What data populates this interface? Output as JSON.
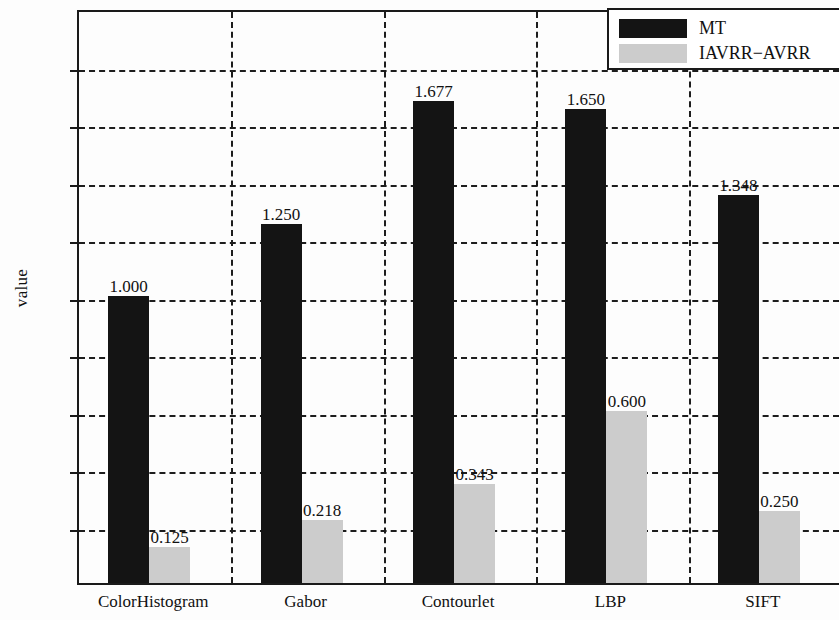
{
  "chart_data": {
    "type": "bar",
    "title": "",
    "subtitle": "",
    "xlabel": "",
    "ylabel": "value",
    "categories": [
      "ColorHistogram",
      "Gabor",
      "Contourlet",
      "LBP",
      "SIFT"
    ],
    "series": [
      {
        "name": "MT",
        "color": "#141414",
        "values": [
          1.0,
          1.25,
          1.677,
          1.65,
          1.348
        ],
        "labels": [
          "1.000",
          "1.250",
          "1.677",
          "1.650",
          "1.348"
        ]
      },
      {
        "name": "IAVRR−AVRR",
        "color": "#cccccc",
        "values": [
          0.125,
          0.218,
          0.343,
          0.6,
          0.25
        ],
        "labels": [
          "0.125",
          "0.218",
          "0.343",
          "0.600",
          "0.250"
        ]
      }
    ],
    "ylim": [
      0,
      2
    ],
    "ytick_values": [
      0,
      0.2,
      0.4,
      0.6,
      0.8,
      1,
      1.2,
      1.4,
      1.6,
      1.8,
      2
    ],
    "ytick_labels": [
      "0",
      "0.2",
      "0.4",
      "0.6",
      "0.8",
      "1",
      "1.2",
      "1.4",
      "1.6",
      "1.8",
      "2"
    ],
    "grid": "dashed-both",
    "legend_position": "top-right",
    "legend_entries": [
      "MT",
      "IAVRR−AVRR"
    ]
  },
  "axis": {
    "y_label": "value"
  },
  "legend": {
    "items": [
      {
        "label": "MT"
      },
      {
        "label": "IAVRR−AVRR"
      }
    ]
  }
}
